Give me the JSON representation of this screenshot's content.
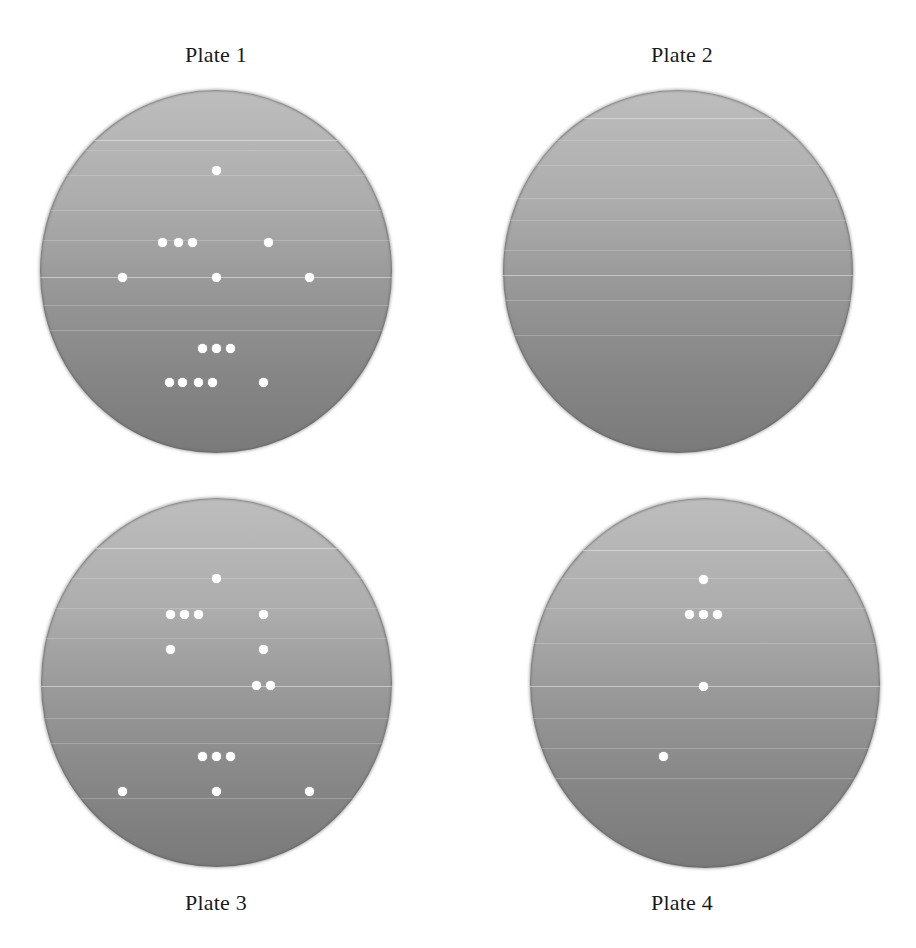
{
  "figure": {
    "colors": {
      "plate_top": "#bdbdbd",
      "plate_bottom": "#7a7a7a",
      "colony": "#ffffff",
      "label": "#1a1a1a"
    },
    "plates": [
      {
        "label": "Plate 1",
        "colony_count": 16,
        "colonies": [
          {
            "x": 216,
            "y": 170
          },
          {
            "x": 162,
            "y": 242
          },
          {
            "x": 178,
            "y": 242
          },
          {
            "x": 192,
            "y": 242
          },
          {
            "x": 268,
            "y": 242
          },
          {
            "x": 122,
            "y": 277
          },
          {
            "x": 216,
            "y": 277
          },
          {
            "x": 309,
            "y": 277
          },
          {
            "x": 202,
            "y": 348
          },
          {
            "x": 216,
            "y": 348
          },
          {
            "x": 230,
            "y": 348
          },
          {
            "x": 169,
            "y": 382
          },
          {
            "x": 182,
            "y": 382
          },
          {
            "x": 198,
            "y": 382
          },
          {
            "x": 212,
            "y": 382
          },
          {
            "x": 263,
            "y": 382
          }
        ]
      },
      {
        "label": "Plate 2",
        "colony_count": 0,
        "colonies": []
      },
      {
        "label": "Plate 3",
        "colony_count": 15,
        "colonies": [
          {
            "x": 216,
            "y": 578
          },
          {
            "x": 170,
            "y": 614
          },
          {
            "x": 184,
            "y": 614
          },
          {
            "x": 198,
            "y": 614
          },
          {
            "x": 263,
            "y": 614
          },
          {
            "x": 170,
            "y": 649
          },
          {
            "x": 263,
            "y": 649
          },
          {
            "x": 256,
            "y": 685
          },
          {
            "x": 270,
            "y": 685
          },
          {
            "x": 202,
            "y": 756
          },
          {
            "x": 216,
            "y": 756
          },
          {
            "x": 230,
            "y": 756
          },
          {
            "x": 122,
            "y": 791
          },
          {
            "x": 216,
            "y": 791
          },
          {
            "x": 309,
            "y": 791
          }
        ]
      },
      {
        "label": "Plate 4",
        "colony_count": 6,
        "colonies": [
          {
            "x": 703,
            "y": 579
          },
          {
            "x": 689,
            "y": 614
          },
          {
            "x": 703,
            "y": 614
          },
          {
            "x": 717,
            "y": 614
          },
          {
            "x": 703,
            "y": 686
          },
          {
            "x": 663,
            "y": 756
          }
        ]
      }
    ]
  }
}
